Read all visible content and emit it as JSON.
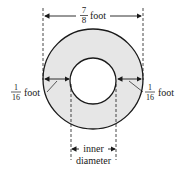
{
  "diagram": {
    "type": "annulus-dimension-diagram",
    "outer_diameter": {
      "numerator": "7",
      "denominator": "8",
      "unit": "foot"
    },
    "left_thickness": {
      "numerator": "1",
      "denominator": "16",
      "unit": "foot"
    },
    "right_thickness": {
      "numerator": "1",
      "denominator": "16",
      "unit": "foot"
    },
    "inner_label": {
      "line1": "inner",
      "line2": "diameter"
    },
    "colors": {
      "ring_fill": "#e6e6e6",
      "stroke": "#1a1a1a",
      "background": "#ffffff"
    }
  }
}
